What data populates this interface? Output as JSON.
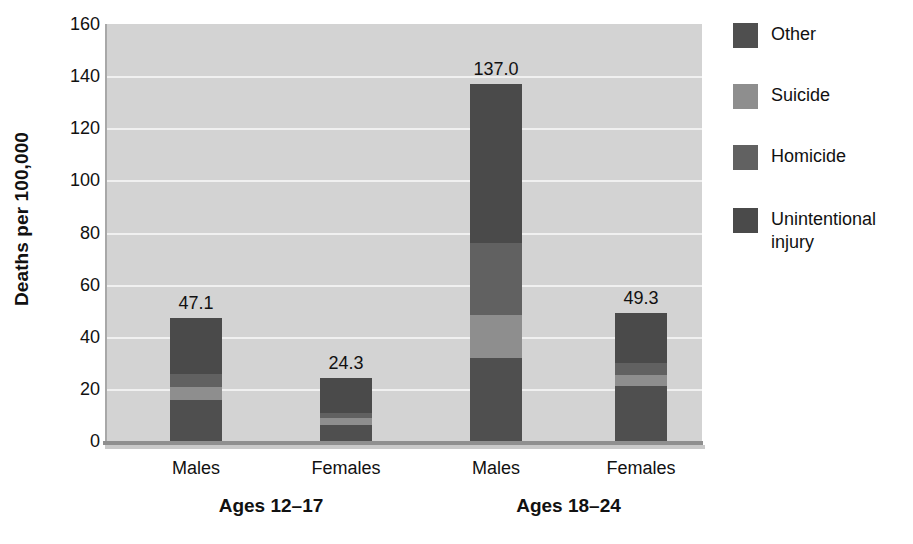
{
  "chart_data": {
    "type": "bar",
    "subtype": "stacked-bar",
    "title": "",
    "xlabel": "",
    "ylabel": "Deaths per 100,000",
    "ylim": [
      0,
      160
    ],
    "ytick_step": 20,
    "yticks": [
      "160",
      "140",
      "120",
      "100",
      "80",
      "60",
      "40",
      "20",
      "0"
    ],
    "grid": true,
    "grid_axis": "y",
    "legend_position": "right",
    "categories": [
      "Males",
      "Females",
      "Males",
      "Females"
    ],
    "groups": [
      {
        "label": "Ages 12–17",
        "categories": [
          "Males",
          "Females"
        ]
      },
      {
        "label": "Ages 18–24",
        "categories": [
          "Males",
          "Females"
        ]
      }
    ],
    "series": [
      {
        "name": "Unintentional injury",
        "color": "#4a4a4a",
        "values": [
          21.5,
          13.5,
          61.0,
          19.5
        ]
      },
      {
        "name": "Homicide",
        "color": "#616161",
        "values": [
          5.0,
          2.0,
          27.5,
          4.5
        ]
      },
      {
        "name": "Suicide",
        "color": "#8e8e8e",
        "values": [
          5.0,
          2.5,
          16.5,
          4.0
        ]
      },
      {
        "name": "Other",
        "color": "#4f4f4f",
        "values": [
          15.6,
          6.3,
          32.0,
          21.3
        ]
      }
    ],
    "bar_totals": [
      47.1,
      24.3,
      137.0,
      49.3
    ],
    "bar_total_labels": [
      "47.1",
      "24.3",
      "137.0",
      "49.3"
    ],
    "plot_background": "#d3d3d3",
    "gridline_color": "#f0f0f0",
    "axis_color": "#8f8f8f"
  },
  "axis": {
    "y_title": "Deaths per 100,000"
  },
  "legend": {
    "items": [
      {
        "label": "Other",
        "color": "#4f4f4f"
      },
      {
        "label": "Suicide",
        "color": "#8e8e8e"
      },
      {
        "label": "Homicide",
        "color": "#616161"
      },
      {
        "label": "Unintentional\ninjury",
        "color": "#4a4a4a"
      }
    ]
  }
}
